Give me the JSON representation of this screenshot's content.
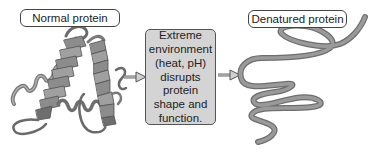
{
  "labels": {
    "normal": "Normal protein",
    "denatured": "Denatured protein"
  },
  "process_box": {
    "lines": [
      "Extreme",
      "environment",
      "(heat, pH)",
      "disrupts",
      "protein",
      "shape and",
      "function."
    ]
  },
  "icons": {
    "left_arrow": "arrow-right",
    "right_arrow": "arrow-right",
    "folded_protein": "ribbon-diagram",
    "unfolded_protein": "random-coil"
  },
  "colors": {
    "background": "#ffffff",
    "box_fill": "#d4d4d4",
    "ribbon": "#8a8a8a",
    "ribbon_dark": "#5e5e5e",
    "strand": "#909090"
  }
}
